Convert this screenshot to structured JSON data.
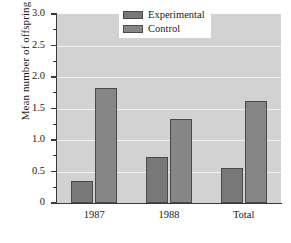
{
  "chart_data": {
    "type": "bar",
    "title": "",
    "xlabel": "",
    "ylabel": "Mean number of offspring",
    "categories": [
      "1987",
      "1988",
      "Total"
    ],
    "series": [
      {
        "name": "Experimental",
        "values": [
          0.35,
          0.73,
          0.56
        ],
        "color": "#787878"
      },
      {
        "name": "Control",
        "values": [
          1.82,
          1.33,
          1.62
        ],
        "color": "#868686"
      }
    ],
    "ylim": [
      0,
      3.0
    ],
    "ytick_labels": [
      "0",
      "0.5",
      "1.0",
      "1.5",
      "2.0",
      "2.5",
      "3.0"
    ],
    "ytick_values": [
      0,
      0.5,
      1.0,
      1.5,
      2.0,
      2.5,
      3.0
    ],
    "yminor_values": [
      0.25,
      0.75,
      1.25,
      1.75,
      2.25,
      2.75
    ],
    "grid": true,
    "gridline_values": [
      0.5,
      1.0,
      1.5,
      2.0,
      2.5
    ],
    "legend_position": "top-right",
    "plot_background": "#d2d2d2",
    "gridline_color": "#f2f2f2",
    "axis_color": "#3a3a3a"
  },
  "legend": {
    "entries": [
      {
        "label": "Experimental"
      },
      {
        "label": "Control"
      }
    ]
  }
}
